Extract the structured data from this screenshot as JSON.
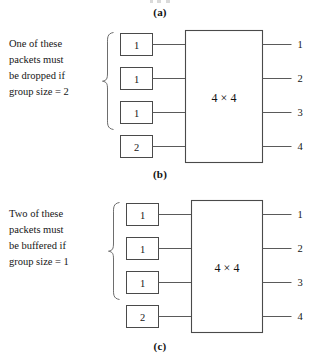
{
  "figure": {
    "captions": {
      "a": "(a)",
      "b": "(b)",
      "c": "(c)"
    }
  },
  "panel_b": {
    "caption": "(b)",
    "annotation": {
      "line1": "One of these",
      "line2": "packets must",
      "line3": "be dropped if",
      "line4": "group size = 2"
    },
    "switch_label": "4 × 4",
    "inputs": [
      {
        "label": "1"
      },
      {
        "label": "1"
      },
      {
        "label": "1"
      },
      {
        "label": "2"
      }
    ],
    "outputs": [
      {
        "label": "1"
      },
      {
        "label": "2"
      },
      {
        "label": "3"
      },
      {
        "label": "4"
      }
    ]
  },
  "panel_c": {
    "caption": "(c)",
    "annotation": {
      "line1": "Two of these",
      "line2": "packets must",
      "line3": "be buffered if",
      "line4": "group size = 1"
    },
    "switch_label": "4 × 4",
    "inputs": [
      {
        "label": "1"
      },
      {
        "label": "1"
      },
      {
        "label": "1"
      },
      {
        "label": "2"
      }
    ],
    "outputs": [
      {
        "label": "1"
      },
      {
        "label": "2"
      },
      {
        "label": "3"
      },
      {
        "label": "4"
      }
    ]
  },
  "colors": {
    "background": "#ffffff",
    "line": "#5a5a5a",
    "box_border": "#4a4a4a",
    "brace": "#6d6d6d",
    "text": "#161616"
  }
}
